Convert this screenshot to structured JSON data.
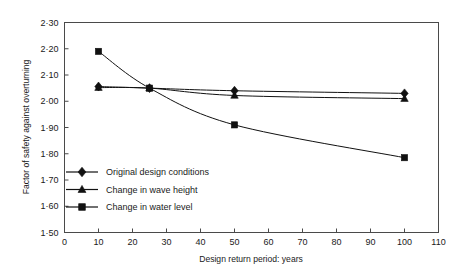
{
  "chart_data": {
    "type": "line",
    "title": "",
    "xlabel": "Design return period: years",
    "ylabel": "Factor of safety against overturning",
    "xlim": [
      0,
      110
    ],
    "ylim": [
      1.5,
      2.3
    ],
    "grid": false,
    "legend_position": "inside-lower-left",
    "x": [
      10,
      25,
      50,
      100
    ],
    "xticks": [
      0,
      10,
      20,
      30,
      40,
      50,
      60,
      70,
      80,
      90,
      100,
      110
    ],
    "xtick_labels": [
      "0",
      "10",
      "20",
      "30",
      "40",
      "50",
      "60",
      "70",
      "80",
      "90",
      "100",
      "110"
    ],
    "yticks": [
      1.5,
      1.6,
      1.7,
      1.8,
      1.9,
      2.0,
      2.1,
      2.2,
      2.3
    ],
    "ytick_labels": [
      "1·50",
      "1·60",
      "1·70",
      "1·80",
      "1·90",
      "2·00",
      "2·10",
      "2·20",
      "2·30"
    ],
    "series": [
      {
        "name": "Original design conditions",
        "marker": "diamond",
        "color": "#111111",
        "values": [
          2.056,
          2.05,
          2.04,
          2.03
        ]
      },
      {
        "name": "Change in wave height",
        "marker": "triangle",
        "color": "#111111",
        "values": [
          2.052,
          2.05,
          2.022,
          2.01
        ]
      },
      {
        "name": "Change in water level",
        "marker": "square",
        "color": "#111111",
        "values": [
          2.19,
          2.05,
          1.91,
          1.785
        ]
      }
    ]
  },
  "legend": {
    "items": [
      {
        "label": "Original design conditions",
        "marker": "diamond"
      },
      {
        "label": "Change in wave height",
        "marker": "triangle"
      },
      {
        "label": "Change in water level",
        "marker": "square"
      }
    ]
  }
}
